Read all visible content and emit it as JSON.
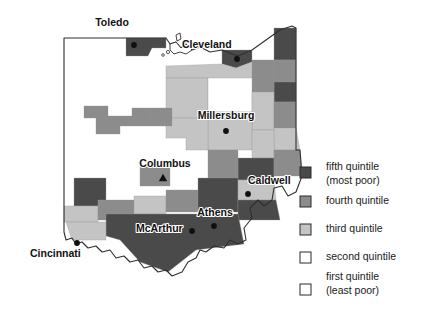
{
  "figure": {
    "kind": "choropleth-map",
    "region": "Ohio",
    "background_color": "#ffffff"
  },
  "palette": {
    "fifth_quintile": "#4a4a4a",
    "fourth_quintile": "#8c8c8c",
    "third_quintile": "#c4c4c4",
    "second_quintile": "#ffffff",
    "first_quintile": "#ffffff",
    "outline": "#2f2f2f",
    "county_border": "#9a9a9a",
    "label_text": "#111111",
    "marker": "#101010"
  },
  "cities": [
    {
      "name": "Toledo",
      "label_x": 112,
      "label_y": 26,
      "anchor": "middle",
      "marker": "dot",
      "marker_x": 134,
      "marker_y": 45
    },
    {
      "name": "Cleveland",
      "label_x": 182,
      "label_y": 48,
      "anchor": "start",
      "marker": "dot",
      "marker_x": 237,
      "marker_y": 59
    },
    {
      "name": "Millersburg",
      "label_x": 226,
      "label_y": 119,
      "anchor": "middle",
      "marker": "dot",
      "marker_x": 226,
      "marker_y": 131
    },
    {
      "name": "Columbus",
      "label_x": 165,
      "label_y": 167,
      "anchor": "middle",
      "marker": "triangle",
      "marker_x": 163,
      "marker_y": 178
    },
    {
      "name": "Caldwell",
      "label_x": 248,
      "label_y": 184,
      "anchor": "start",
      "marker": "dot",
      "marker_x": 248,
      "marker_y": 194
    },
    {
      "name": "Athens",
      "label_x": 215,
      "label_y": 216,
      "anchor": "middle",
      "marker": "dot",
      "marker_x": 214,
      "marker_y": 226
    },
    {
      "name": "McArthur",
      "label_x": 136,
      "label_y": 232,
      "anchor": "start",
      "marker": "dot",
      "marker_x": 192,
      "marker_y": 231
    },
    {
      "name": "Cincinnati",
      "label_x": 30,
      "label_y": 257,
      "anchor": "start",
      "marker": "dot",
      "marker_x": 77,
      "marker_y": 243
    }
  ],
  "legend": {
    "swatch_x": 300,
    "swatch_size": 11,
    "label_x": 326,
    "items": [
      {
        "key": "fifth",
        "line1": "fifth quintile",
        "line2": "(most poor)",
        "color": "#4a4a4a",
        "swatch_y": 167,
        "text_y": 170
      },
      {
        "key": "fourth",
        "line1": "fourth quintile",
        "line2": "",
        "color": "#8c8c8c",
        "swatch_y": 196,
        "text_y": 204
      },
      {
        "key": "third",
        "line1": "third quintile",
        "line2": "",
        "color": "#c4c4c4",
        "swatch_y": 224,
        "text_y": 232
      },
      {
        "key": "second",
        "line1": "second quintile",
        "line2": "",
        "color": "#ffffff",
        "swatch_y": 252,
        "text_y": 260
      },
      {
        "key": "first",
        "line1": "first quintile",
        "line2": "(least poor)",
        "color": "#ffffff",
        "swatch_y": 284,
        "text_y": 280
      }
    ]
  },
  "chart_data": {
    "type": "map",
    "title": "",
    "map_region": "Ohio",
    "value_field": "poverty quintile",
    "classes": [
      {
        "rank": 5,
        "label": "fifth quintile (most poor)",
        "color": "#4a4a4a"
      },
      {
        "rank": 4,
        "label": "fourth quintile",
        "color": "#8c8c8c"
      },
      {
        "rank": 3,
        "label": "third quintile",
        "color": "#c4c4c4"
      },
      {
        "rank": 2,
        "label": "second quintile",
        "color": "#ffffff"
      },
      {
        "rank": 1,
        "label": "first quintile (least poor)",
        "color": "#ffffff"
      }
    ],
    "legend_position": "right",
    "annotations": [
      "Toledo",
      "Cleveland",
      "Millersburg",
      "Columbus",
      "Caldwell",
      "Athens",
      "McArthur",
      "Cincinnati"
    ],
    "regions": [
      {
        "id": "r1",
        "quintile": 5,
        "color": "#4a4a4a",
        "d": "M126 38 L166 38 L166 48 L152 48 L148 56 L126 56 Z"
      },
      {
        "id": "r2",
        "quintile": 5,
        "color": "#4a4a4a",
        "d": "M222 50 L252 50 L252 62 L236 68 L222 64 Z"
      },
      {
        "id": "r3",
        "quintile": 5,
        "color": "#4a4a4a",
        "d": "M274 28 L296 28 L296 60 L274 60 Z"
      },
      {
        "id": "r4",
        "quintile": 4,
        "color": "#8c8c8c",
        "d": "M274 60 L296 60 L296 82 L274 82 Z"
      },
      {
        "id": "r5",
        "quintile": 5,
        "color": "#4a4a4a",
        "d": "M274 82 L296 82 L296 102 L274 102 Z"
      },
      {
        "id": "r6",
        "quintile": 4,
        "color": "#8c8c8c",
        "d": "M252 60 L274 60 L274 102 L258 102 L252 92 Z"
      },
      {
        "id": "r7",
        "quintile": 3,
        "color": "#c4c4c4",
        "d": "M166 66 L222 64 L236 68 L252 62 L252 92 L208 92 L208 78 L166 78 Z"
      },
      {
        "id": "r8",
        "quintile": 3,
        "color": "#c4c4c4",
        "d": "M166 78 L208 78 L208 118 L166 118 Z"
      },
      {
        "id": "r9",
        "quintile": 2,
        "color": "#ffffff",
        "d": "M208 78 L252 78 L252 112 L208 112 Z"
      },
      {
        "id": "r10",
        "quintile": 3,
        "color": "#c4c4c4",
        "d": "M252 92 L274 92 L274 130 L252 130 Z"
      },
      {
        "id": "r11",
        "quintile": 4,
        "color": "#8c8c8c",
        "d": "M274 102 L296 102 L296 128 L274 128 Z"
      },
      {
        "id": "r12",
        "quintile": 3,
        "color": "#c4c4c4",
        "d": "M208 112 L252 112 L252 150 L208 150 Z"
      },
      {
        "id": "r13",
        "quintile": 3,
        "color": "#c4c4c4",
        "d": "M166 118 L208 118 L208 150 L186 150 L186 138 L166 138 Z"
      },
      {
        "id": "r14",
        "quintile": 4,
        "color": "#8c8c8c",
        "d": "M84 106 L108 106 L108 116 L132 116 L132 108 L150 108 L150 126 L120 126 L120 134 L96 134 L96 118 L84 118 Z"
      },
      {
        "id": "r15",
        "quintile": 4,
        "color": "#8c8c8c",
        "d": "M150 108 L172 108 L172 126 L150 126 Z"
      },
      {
        "id": "r16",
        "quintile": 3,
        "color": "#c4c4c4",
        "d": "M274 128 L296 128 L300 150 L274 150 Z"
      },
      {
        "id": "r17",
        "quintile": 3,
        "color": "#c4c4c4",
        "d": "M252 130 L274 130 L274 158 L252 158 Z"
      },
      {
        "id": "r18",
        "quintile": 5,
        "color": "#4a4a4a",
        "d": "M238 158 L274 158 L274 180 L238 180 Z"
      },
      {
        "id": "r19",
        "quintile": 4,
        "color": "#8c8c8c",
        "d": "M274 150 L300 150 L302 176 L274 176 Z"
      },
      {
        "id": "r20",
        "quintile": 4,
        "color": "#8c8c8c",
        "d": "M208 150 L238 150 L238 178 L208 178 Z"
      },
      {
        "id": "r21",
        "quintile": 4,
        "color": "#8c8c8c",
        "d": "M140 166 L170 166 L170 186 L140 186 Z"
      },
      {
        "id": "r22",
        "quintile": 5,
        "color": "#4a4a4a",
        "d": "M74 178 L106 178 L106 206 L74 206 Z"
      },
      {
        "id": "r23",
        "quintile": 3,
        "color": "#c4c4c4",
        "d": "M64 206 L98 206 L98 222 L64 222 Z"
      },
      {
        "id": "r24",
        "quintile": 4,
        "color": "#8c8c8c",
        "d": "M98 200 L134 200 L134 220 L98 220 Z"
      },
      {
        "id": "r25",
        "quintile": 3,
        "color": "#c4c4c4",
        "d": "M134 196 L166 196 L166 214 L134 214 Z"
      },
      {
        "id": "r26",
        "quintile": 4,
        "color": "#8c8c8c",
        "d": "M166 190 L198 190 L198 212 L166 212 Z"
      },
      {
        "id": "r27",
        "quintile": 5,
        "color": "#4a4a4a",
        "d": "M198 178 L238 178 L238 212 L198 212 Z"
      },
      {
        "id": "r28",
        "quintile": 3,
        "color": "#c4c4c4",
        "d": "M238 180 L274 180 L276 200 L238 200 Z"
      },
      {
        "id": "r29",
        "quintile": 5,
        "color": "#4a4a4a",
        "d": "M238 200 L276 200 L280 220 L238 220 Z"
      },
      {
        "id": "r30",
        "quintile": 5,
        "color": "#4a4a4a",
        "d": "M106 214 L238 214 L244 244 L196 250 L168 272 L140 262 L120 240 L106 236 Z"
      },
      {
        "id": "r31",
        "quintile": 3,
        "color": "#c4c4c4",
        "d": "M66 222 L106 222 L106 240 L72 240 Z"
      }
    ]
  }
}
